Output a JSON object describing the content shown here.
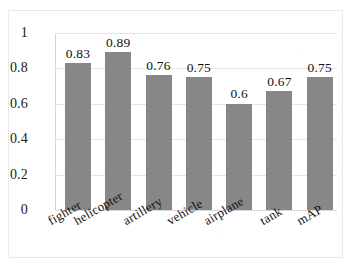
{
  "chart_data": {
    "type": "bar",
    "title": "",
    "subtitle": "",
    "xlabel": "",
    "ylabel": "",
    "categories": [
      "fighter",
      "helicopter",
      "artillery",
      "vehicle",
      "airplane",
      "tank",
      "mAP"
    ],
    "values": [
      0.83,
      0.89,
      0.76,
      0.75,
      0.6,
      0.67,
      0.75
    ],
    "value_labels": [
      "0.83",
      "0.89",
      "0.76",
      "0.75",
      "0.6",
      "0.67",
      "0.75"
    ],
    "ylim": [
      0,
      1
    ],
    "ytick_values": [
      0,
      0.2,
      0.4,
      0.6,
      0.8,
      1
    ],
    "ytick_labels": [
      "0",
      "0.2",
      "0.4",
      "0.6",
      "0.8",
      "1"
    ],
    "grid": true,
    "legend": false,
    "legend_position": "none",
    "series": [
      {
        "name": "",
        "values": [
          0.83,
          0.89,
          0.76,
          0.75,
          0.6,
          0.67,
          0.75
        ]
      }
    ],
    "bar_color": "#878787",
    "gridline_color": "#e4e4e4",
    "axis_color": "#d5d5d5",
    "text_color": "#111111",
    "xtick_label_rotation": -30
  }
}
